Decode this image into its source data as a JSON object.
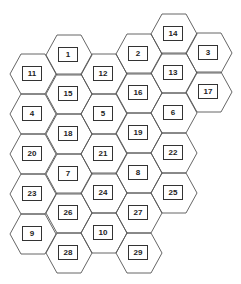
{
  "diagram": {
    "type": "hexagon-grid",
    "stroke_color": "#555555",
    "hex": {
      "half_width": 23,
      "half_top": 12,
      "half_height": 20
    },
    "cells": [
      {
        "label": "1",
        "x": 69,
        "y": 55
      },
      {
        "label": "15",
        "x": 69,
        "y": 94
      },
      {
        "label": "18",
        "x": 69,
        "y": 134
      },
      {
        "label": "7",
        "x": 69,
        "y": 174
      },
      {
        "label": "26",
        "x": 69,
        "y": 213
      },
      {
        "label": "28",
        "x": 69,
        "y": 253
      },
      {
        "label": "11",
        "x": 33,
        "y": 74
      },
      {
        "label": "4",
        "x": 33,
        "y": 114
      },
      {
        "label": "20",
        "x": 33,
        "y": 154
      },
      {
        "label": "23",
        "x": 33,
        "y": 194
      },
      {
        "label": "9",
        "x": 33,
        "y": 234
      },
      {
        "label": "12",
        "x": 104,
        "y": 74
      },
      {
        "label": "5",
        "x": 104,
        "y": 114
      },
      {
        "label": "21",
        "x": 104,
        "y": 154
      },
      {
        "label": "24",
        "x": 104,
        "y": 193
      },
      {
        "label": "10",
        "x": 104,
        "y": 233
      },
      {
        "label": "2",
        "x": 139,
        "y": 54
      },
      {
        "label": "16",
        "x": 139,
        "y": 93
      },
      {
        "label": "19",
        "x": 139,
        "y": 133
      },
      {
        "label": "8",
        "x": 139,
        "y": 173
      },
      {
        "label": "27",
        "x": 139,
        "y": 213
      },
      {
        "label": "29",
        "x": 139,
        "y": 253
      },
      {
        "label": "14",
        "x": 174,
        "y": 34
      },
      {
        "label": "13",
        "x": 174,
        "y": 73
      },
      {
        "label": "6",
        "x": 174,
        "y": 113
      },
      {
        "label": "22",
        "x": 174,
        "y": 153
      },
      {
        "label": "25",
        "x": 174,
        "y": 193
      },
      {
        "label": "3",
        "x": 209,
        "y": 53
      },
      {
        "label": "17",
        "x": 209,
        "y": 92
      }
    ]
  }
}
